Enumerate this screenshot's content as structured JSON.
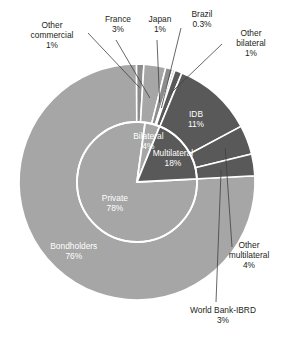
{
  "chart_data": {
    "type": "pie",
    "title": "",
    "xlabel": "",
    "ylabel": "",
    "legend_position": "none",
    "grid": false,
    "note": "Two-level donut / sunburst: inner ring = creditor class, outer ring = creditor detail",
    "rings": [
      {
        "name": "inner",
        "label": "Creditor class",
        "categories": [
          "Private",
          "Bilateral",
          "Multilateral"
        ],
        "values": [
          78,
          4,
          18
        ],
        "value_labels": [
          "78%",
          "4%",
          "18%"
        ],
        "colors": [
          "#a6a6a6",
          "#a6a6a6",
          "#595959"
        ]
      },
      {
        "name": "outer",
        "label": "Creditor detail",
        "categories": [
          "Bondholders",
          "Other commercial",
          "France",
          "Japan",
          "Brazil",
          "Other bilateral",
          "IDB",
          "Other multilateral",
          "World Bank-IBRD"
        ],
        "values": [
          76,
          1,
          3,
          1,
          0.3,
          1,
          11,
          4,
          3
        ],
        "value_labels": [
          "76%",
          "1%",
          "3%",
          "1%",
          "0.3%",
          "1%",
          "11%",
          "4%",
          "3%"
        ],
        "colors": [
          "#a6a6a6",
          "#8c8c8c",
          "#a6a6a6",
          "#8c8c8c",
          "#a6a6a6",
          "#595959",
          "#595959",
          "#595959",
          "#595959"
        ]
      }
    ]
  },
  "labels": {
    "other_commercial": {
      "name": "Other\ncommercial",
      "line1": "Other",
      "line2": "commercial",
      "pct": "1%"
    },
    "france": {
      "name": "France",
      "pct": "3%"
    },
    "japan": {
      "name": "Japan",
      "pct": "1%"
    },
    "brazil": {
      "name": "Brazil",
      "pct": "0.3%"
    },
    "other_bilateral": {
      "line1": "Other",
      "line2": "bilateral",
      "pct": "1%"
    },
    "idb": {
      "name": "IDB",
      "pct": "11%"
    },
    "other_multilateral": {
      "line1": "Other",
      "line2": "multilateral",
      "pct": "4%"
    },
    "world_bank": {
      "name": "World Bank-IBRD",
      "pct": "3%"
    },
    "bondholders": {
      "name": "Bondholders",
      "pct": "76%"
    },
    "private": {
      "name": "Private",
      "pct": "78%"
    },
    "bilateral": {
      "name": "Bilateral",
      "pct": "4%"
    },
    "multilateral": {
      "name": "Multilateral",
      "pct": "18%"
    }
  },
  "colors": {
    "light_gray": "#a6a6a6",
    "mid_gray": "#8c8c8c",
    "dark_gray": "#595959",
    "separator": "#ffffff",
    "leader_line": "#404040",
    "text": "#231f20",
    "inner_text": "#ffffff"
  }
}
